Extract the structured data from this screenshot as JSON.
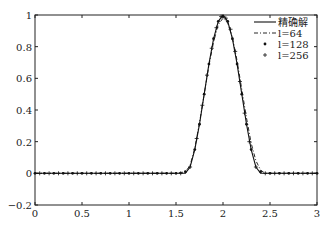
{
  "chart_data": {
    "type": "line",
    "title": "",
    "xlabel": "",
    "ylabel": "",
    "xlim": [
      0,
      3
    ],
    "ylim": [
      -0.2,
      1
    ],
    "grid": false,
    "legend_position": "upper right",
    "x_ticks": [
      "0",
      "0.5",
      "1",
      "1.5",
      "2",
      "2.5",
      "3"
    ],
    "y_ticks": [
      "-0.2",
      "0",
      "0.2",
      "0.4",
      "0.6",
      "0.8",
      "1"
    ],
    "legend": [
      "精确解",
      "l=64",
      "l=128",
      "l=256"
    ],
    "series": [
      {
        "name": "精确解",
        "style": "solid",
        "x": [
          0,
          1.5,
          1.6,
          1.65,
          1.7,
          1.75,
          1.8,
          1.85,
          1.9,
          1.95,
          2.0,
          2.05,
          2.1,
          2.15,
          2.2,
          2.25,
          2.3,
          2.35,
          2.4,
          2.5,
          3
        ],
        "y": [
          0,
          0,
          0,
          0.04,
          0.15,
          0.31,
          0.5,
          0.69,
          0.85,
          0.96,
          1.0,
          0.96,
          0.85,
          0.69,
          0.5,
          0.31,
          0.15,
          0.04,
          0,
          0,
          0
        ]
      },
      {
        "name": "l=64",
        "style": "dash-dot",
        "x": [
          0,
          1.5,
          1.6,
          1.65,
          1.7,
          1.75,
          1.8,
          1.85,
          1.9,
          1.95,
          2.0,
          2.05,
          2.1,
          2.15,
          2.2,
          2.25,
          2.3,
          2.35,
          2.4,
          2.45,
          2.5,
          3
        ],
        "y": [
          0,
          0,
          0.01,
          0.05,
          0.16,
          0.32,
          0.5,
          0.68,
          0.83,
          0.94,
          0.98,
          0.95,
          0.86,
          0.71,
          0.53,
          0.35,
          0.19,
          0.08,
          0.02,
          0,
          0,
          0
        ]
      },
      {
        "name": "l=128",
        "style": "dot-marker",
        "x": [
          0,
          0.1,
          0.2,
          0.3,
          0.4,
          0.5,
          0.6,
          0.7,
          0.8,
          0.9,
          1.0,
          1.1,
          1.2,
          1.3,
          1.4,
          1.5,
          1.6,
          1.7,
          1.75,
          1.8,
          1.85,
          1.9,
          1.95,
          2.0,
          2.05,
          2.1,
          2.15,
          2.2,
          2.25,
          2.3,
          2.4,
          2.5,
          2.6,
          2.7,
          2.8,
          2.9,
          3.0
        ],
        "y": [
          0,
          0,
          0,
          0,
          0,
          0,
          0,
          0,
          0,
          0,
          0,
          0,
          0,
          0,
          0,
          0,
          0.01,
          0.15,
          0.31,
          0.5,
          0.69,
          0.85,
          0.96,
          0.99,
          0.96,
          0.85,
          0.69,
          0.5,
          0.31,
          0.15,
          0.01,
          0,
          0,
          0,
          0,
          0,
          0
        ]
      },
      {
        "name": "l=256",
        "style": "plus-marker",
        "x": [
          0.05,
          0.15,
          0.25,
          0.35,
          0.45,
          0.55,
          0.65,
          0.75,
          0.85,
          0.95,
          1.05,
          1.15,
          1.25,
          1.35,
          1.45,
          1.55,
          1.65,
          1.72,
          1.78,
          1.83,
          1.88,
          1.93,
          1.98,
          2.03,
          2.08,
          2.13,
          2.18,
          2.23,
          2.28,
          2.35,
          2.45,
          2.55,
          2.65,
          2.75,
          2.85,
          2.95
        ],
        "y": [
          0,
          0,
          0,
          0,
          0,
          0,
          0,
          0,
          0,
          0,
          0,
          0,
          0,
          0,
          0,
          0,
          0.04,
          0.22,
          0.43,
          0.62,
          0.79,
          0.92,
          0.99,
          0.98,
          0.91,
          0.77,
          0.58,
          0.38,
          0.2,
          0.04,
          0,
          0,
          0,
          0,
          0,
          0
        ]
      }
    ]
  }
}
